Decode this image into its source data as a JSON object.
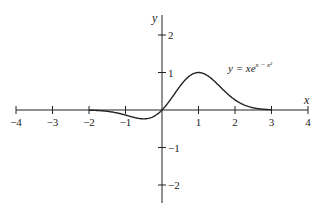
{
  "chart_data": {
    "type": "line",
    "title": "",
    "xlabel": "x",
    "ylabel": "y",
    "xlim": [
      -4,
      4
    ],
    "ylim": [
      -2.5,
      2.5
    ],
    "grid": false,
    "x_ticks": [
      -4,
      -3,
      -2,
      -1,
      1,
      2,
      3,
      4
    ],
    "x_tick_labels": [
      "−4",
      "−3",
      "−2",
      "−1",
      "1",
      "2",
      "3",
      "4"
    ],
    "y_ticks": [
      2,
      1,
      -1,
      -2
    ],
    "y_tick_labels": [
      "2",
      "1",
      "−1",
      "−2"
    ],
    "series": [
      {
        "name": "y = xe^(x − x²)",
        "function": "x*exp(x - x^2)",
        "x": [
          -2.0,
          -1.5,
          -1.0,
          -0.75,
          -0.5,
          -0.25,
          0,
          0.25,
          0.5,
          0.75,
          1.0,
          1.25,
          1.5,
          1.75,
          2.0,
          2.5,
          3.0
        ],
        "values": [
          -0.005,
          -0.035,
          -0.135,
          -0.209,
          -0.236,
          -0.182,
          0,
          0.302,
          0.642,
          0.907,
          1.0,
          0.906,
          0.708,
          0.471,
          0.271,
          0.059,
          0.007
        ]
      }
    ],
    "annotations": [
      {
        "text_base": "y = xe",
        "text_sup": "x − x²",
        "x": 1.9,
        "y": 1.2
      }
    ]
  }
}
